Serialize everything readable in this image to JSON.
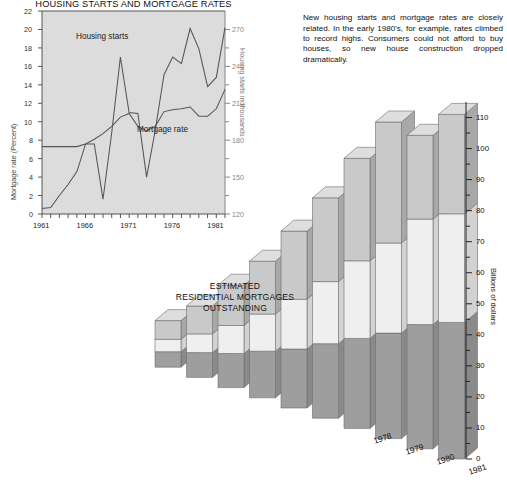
{
  "line_chart": {
    "title": "HOUSING STARTS AND MORTGAGE RATES",
    "left_axis_title": "Mortgage rate (Percent)",
    "right_axis_title": "Housing starts in thousands",
    "series_labels": {
      "starts": "Housing starts",
      "rate": "Mortgage rate"
    }
  },
  "intro_text": "New housing starts and mortgage rates are closely related. In the early 1980's, for example, rates climbed to record highs. Consumers could not afford to buy houses, so new house construction dropped dramatically.",
  "bar_chart": {
    "title_line1": "ESTIMATED",
    "title_line2": "RESIDENTIAL MORTGAGES",
    "title_line3": "OUTSTANDING",
    "axis_title": "Billions of dollars",
    "legend": [
      "Credit unions",
      "Estate trust and agency funds",
      "Life insurers"
    ]
  },
  "chart_data": [
    {
      "type": "line",
      "title": "HOUSING STARTS AND MORTGAGE RATES",
      "xlabel": "",
      "ylabel": "Mortgage rate (Percent)",
      "y2label": "Housing starts in thousands",
      "xlim": [
        1961,
        1982
      ],
      "ylim": [
        0,
        22
      ],
      "y2lim": [
        120,
        285
      ],
      "yticks": [
        0,
        2,
        4,
        6,
        8,
        10,
        12,
        14,
        16,
        18,
        20,
        22
      ],
      "y2ticks": [
        120,
        150,
        180,
        210,
        240,
        270
      ],
      "xticks": [
        1961,
        1966,
        1971,
        1976,
        1981
      ],
      "grid": false,
      "legend_position": "inline-annotations",
      "x": [
        1961,
        1962,
        1963,
        1964,
        1965,
        1966,
        1967,
        1968,
        1969,
        1970,
        1971,
        1972,
        1973,
        1974,
        1975,
        1976,
        1977,
        1978,
        1979,
        1980,
        1981,
        1982
      ],
      "series": [
        {
          "name": "Mortgage rate",
          "axis": "left",
          "units": "percent",
          "values": [
            7.3,
            7.3,
            7.3,
            7.3,
            7.3,
            7.6,
            8.1,
            8.7,
            9.5,
            10.5,
            10.9,
            9.5,
            9.0,
            9.5,
            11.1,
            11.3,
            11.4,
            11.6,
            10.6,
            10.6,
            11.4,
            13.5
          ]
        },
        {
          "name": "Housing starts",
          "axis": "right",
          "units": "thousands",
          "values": [
            125,
            131,
            162,
            172,
            177,
            180,
            153,
            191,
            230,
            148,
            215,
            240,
            260,
            285,
            250,
            230,
            285,
            245,
            225,
            200,
            152,
            178
          ]
        }
      ],
      "series_left_as_drawn_percent_scale": {
        "Housing starts": [
          0.6,
          0.7,
          2.0,
          3.2,
          4.6,
          7.6,
          7.6,
          1.6,
          8.8,
          17.0,
          11.0,
          10.9,
          4.0,
          9.1,
          15.1,
          17.0,
          16.3,
          20.1,
          17.9,
          13.8,
          14.8,
          20.2
        ]
      }
    },
    {
      "type": "bar",
      "subtype": "stacked-3d",
      "title": "ESTIMATED RESIDENTIAL MORTGAGES OUTSTANDING",
      "ylabel": "Billions of dollars",
      "ylim": [
        0,
        115
      ],
      "yticks": [
        0,
        10,
        20,
        30,
        40,
        50,
        60,
        70,
        80,
        90,
        100,
        110
      ],
      "categories": [
        "",
        "",
        "",
        "",
        "",
        "",
        "1978",
        "1979",
        "1980",
        "1981"
      ],
      "visible_year_labels": [
        "1978",
        "1979",
        "1980",
        "1981"
      ],
      "stack_order_bottom_to_top": [
        "Life insurers",
        "Estate trust and agency funds",
        "Credit unions"
      ],
      "series": [
        {
          "name": "Life insurers",
          "values": [
            5,
            8,
            11,
            15,
            19,
            24,
            29,
            34,
            40,
            44
          ]
        },
        {
          "name": "Estate trust and agency funds",
          "values": [
            4,
            6,
            9,
            12,
            16,
            20,
            25,
            29,
            34,
            35
          ]
        },
        {
          "name": "Credit unions",
          "values": [
            6,
            9,
            13,
            17,
            22,
            27,
            33,
            39,
            27,
            32
          ]
        }
      ],
      "totals": [
        15,
        23,
        33,
        44,
        57,
        71,
        87,
        102,
        101,
        111
      ]
    }
  ]
}
